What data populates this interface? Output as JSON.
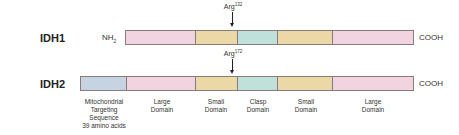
{
  "rows": [
    {
      "label": "IDH1",
      "n_term": "NH",
      "n_term_sub": "2",
      "c_term": "COOH",
      "mutation": {
        "residue": "Arg",
        "position": "132"
      },
      "segments": [
        {
          "domain": "Large Domain",
          "color": "#f1d4e0"
        },
        {
          "domain": "Small Domain",
          "color": "#ead9a6"
        },
        {
          "domain": "Clasp Domain",
          "color": "#bfe1d9"
        },
        {
          "domain": "Small Domain",
          "color": "#ead9a6"
        },
        {
          "domain": "Large Domain",
          "color": "#f1d4e0"
        }
      ]
    },
    {
      "label": "IDH2",
      "c_term": "COOH",
      "mutation": {
        "residue": "Arg",
        "position": "172"
      },
      "segments": [
        {
          "domain": "Mitochondrial Targeting Sequence",
          "color": "#c6d3e3"
        },
        {
          "domain": "Large Domain",
          "color": "#f1d4e0"
        },
        {
          "domain": "Small Domain",
          "color": "#ead9a6"
        },
        {
          "domain": "Clasp Domain",
          "color": "#bfe1d9"
        },
        {
          "domain": "Small Domain",
          "color": "#ead9a6"
        },
        {
          "domain": "Large Domain",
          "color": "#f1d4e0"
        }
      ]
    }
  ],
  "domain_labels": {
    "mts": [
      "Mitochondrial",
      "Targeting",
      "Sequence",
      "39 amino acids"
    ],
    "large1": [
      "Large",
      "Domain"
    ],
    "small1": [
      "Small",
      "Domain"
    ],
    "clasp": [
      "Clasp",
      "Domain"
    ],
    "small2": [
      "Small",
      "Domain"
    ],
    "large2": [
      "Large",
      "Domain"
    ]
  }
}
